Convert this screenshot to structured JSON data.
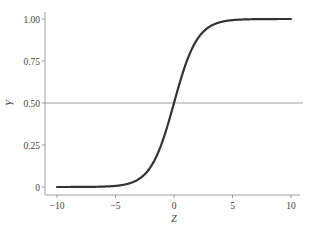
{
  "chart_data": {
    "type": "line",
    "title": "",
    "xlabel": "Z",
    "ylabel": "Y",
    "xlim": [
      -10,
      10
    ],
    "ylim": [
      0,
      1
    ],
    "x_ticks": [
      -10,
      -5,
      0,
      5,
      10
    ],
    "x_tick_labels": [
      "−10",
      "−5",
      "0",
      "5",
      "10"
    ],
    "y_ticks": [
      0,
      0.25,
      0.5,
      0.75,
      1.0
    ],
    "y_tick_labels": [
      "0",
      "0.25",
      "0.50",
      "0.75",
      "1.00"
    ],
    "grid": false,
    "legend": null,
    "series": [
      {
        "name": "sigmoid",
        "function": "Y = 1 / (1 + exp(-Z))",
        "x": [
          -10,
          -8,
          -6,
          -5,
          -4,
          -3,
          -2,
          -1,
          0,
          1,
          2,
          3,
          4,
          5,
          6,
          8,
          10
        ],
        "values": [
          0.0,
          0.0003,
          0.0025,
          0.0067,
          0.018,
          0.0474,
          0.1192,
          0.2689,
          0.5,
          0.7311,
          0.8808,
          0.9526,
          0.982,
          0.9933,
          0.9975,
          0.9997,
          1.0
        ],
        "color": "#333333"
      }
    ],
    "annotations": [
      {
        "type": "hline",
        "y": 0.5,
        "color": "#888888"
      }
    ]
  },
  "colors": {
    "curve": "#333333",
    "reference_line": "#8a8a8a",
    "axis": "#888888",
    "text": "#444444"
  }
}
